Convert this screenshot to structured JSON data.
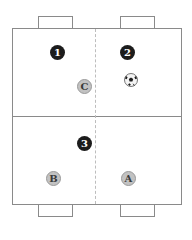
{
  "diagram": {
    "type": "soccer-drill-field",
    "colors": {
      "line": "#8a8a8a",
      "numbered_player": "#1c1c1c",
      "lettered_player": "#c2c2c2"
    },
    "numbered_players": [
      {
        "label": "1",
        "x": 57,
        "y": 52
      },
      {
        "label": "2",
        "x": 127,
        "y": 52
      },
      {
        "label": "3",
        "x": 84,
        "y": 143
      }
    ],
    "lettered_players": [
      {
        "label": "C",
        "x": 84,
        "y": 86
      },
      {
        "label": "B",
        "x": 53,
        "y": 178
      },
      {
        "label": "A",
        "x": 128,
        "y": 178
      }
    ],
    "ball": {
      "icon": "soccer-ball-icon",
      "x": 131,
      "y": 79
    }
  }
}
